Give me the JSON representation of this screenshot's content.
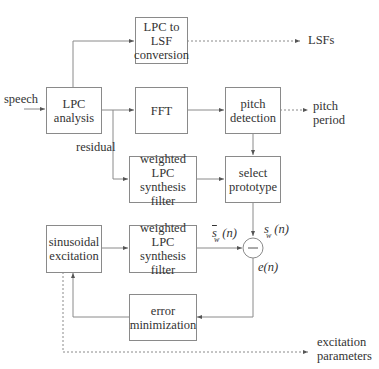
{
  "blocks": {
    "lpc_to_lsf": {
      "lines": [
        "LPC to",
        "LSF",
        "conversion"
      ]
    },
    "lpc_analysis": {
      "lines": [
        "LPC",
        "analysis"
      ]
    },
    "fft": {
      "lines": [
        "FFT"
      ]
    },
    "pitch_detection": {
      "lines": [
        "pitch",
        "detection"
      ]
    },
    "weighted_filter_top": {
      "lines": [
        "weighted",
        "LPC synthesis",
        "filter"
      ]
    },
    "select_prototype": {
      "lines": [
        "select",
        "prototype"
      ]
    },
    "sinusoidal_excitation": {
      "lines": [
        "sinusoidal",
        "excitation"
      ]
    },
    "weighted_filter_bottom": {
      "lines": [
        "weighted",
        "LPC synthesis",
        "filter"
      ]
    },
    "error_minimization": {
      "lines": [
        "error",
        "minimization"
      ]
    }
  },
  "labels": {
    "speech": "speech",
    "residual": "residual",
    "lsfs": "LSFs",
    "pitch_period": [
      "pitch",
      "period"
    ],
    "excitation_parameters": [
      "excitation",
      "parameters"
    ],
    "s_bar": {
      "base": "s",
      "sub": "w",
      "arg": "(n)"
    },
    "s_w": {
      "base": "s",
      "sub": "w",
      "arg": "(n)"
    },
    "error": "e(n)",
    "sum_sign": "—"
  },
  "colors": {
    "line": "#8a8a8a",
    "text": "#333333",
    "background": "#ffffff"
  }
}
